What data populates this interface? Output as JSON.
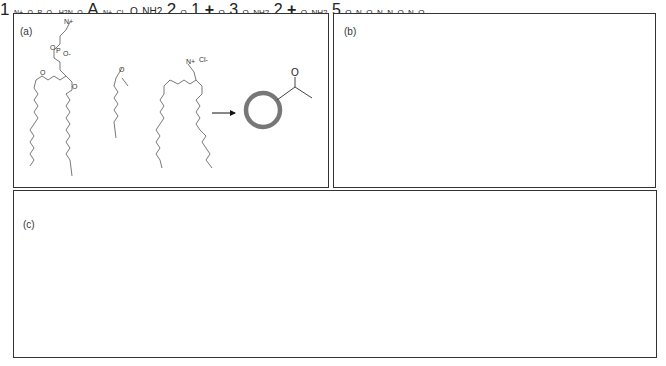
{
  "figure": {
    "panels": [
      {
        "id": "a",
        "label": "(a)",
        "components": [
          "phosphatidylcholine lipid",
          "ketone-terminated alkyl chain",
          "cationic lipid (Cl-)"
        ],
        "product_label": "1",
        "product_group": "O",
        "ring_color": "#777777"
      },
      {
        "id": "b",
        "label": "(b)",
        "components": [
          "phosphatidylcholine lipid",
          "oxyamine-terminated alkyl chain",
          "cationic lipid (Cl-)"
        ],
        "compound_label": "A",
        "amine_text": "H2N",
        "product_label": "2",
        "product_group_o": "O",
        "product_group_nh2": "NH2",
        "ring_color": "#111111"
      },
      {
        "id": "c",
        "label": "(c)",
        "row1": {
          "vesicle_label": "1",
          "cell_label": "3",
          "group": "O"
        },
        "row2": {
          "vesicle_label": "2",
          "cell_label": "5",
          "group_o": "O",
          "group_nh2": "NH2"
        },
        "plus": "+",
        "oxime_o": "O",
        "oxime_n": "N"
      }
    ],
    "chem_text": {
      "n_plus": "N+",
      "cl_minus": "Cl-",
      "p": "P",
      "o": "O",
      "o_minus": "O-"
    }
  }
}
